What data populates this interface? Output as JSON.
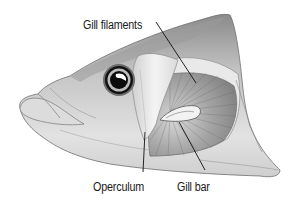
{
  "figure": {
    "labels": {
      "gill_filaments": "Gill filaments",
      "operculum": "Operculum",
      "gill_bar": "Gill bar"
    },
    "colors": {
      "background": "#ffffff",
      "ink": "#1a1a1a",
      "skin_light": "#e6e6e6",
      "skin_mid": "#bdbdbd",
      "skin_dark": "#7a7a7a",
      "gill_dark": "#8c8c8c",
      "leader_line": "#111111"
    },
    "leader_lines": {
      "gill_filaments": [
        [
          156,
          22
        ],
        [
          196,
          83
        ]
      ],
      "operculum": [
        [
          145,
          132
        ],
        [
          143,
          172
        ]
      ],
      "gill_bar": [
        [
          179,
          122
        ],
        [
          205,
          170
        ]
      ]
    }
  }
}
